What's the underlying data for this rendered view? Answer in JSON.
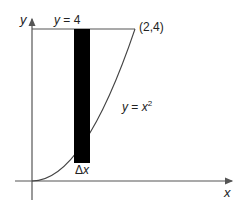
{
  "diagram": {
    "axes": {
      "x_label": "x",
      "y_label": "y"
    },
    "labels": {
      "top_line": "y = 4",
      "point": "(2,4)",
      "curve": "y = x",
      "curve_exponent": "2",
      "strip_width": "Δx"
    },
    "colors": {
      "line": "#555555",
      "strip": "#000000",
      "background": "#ffffff"
    }
  }
}
